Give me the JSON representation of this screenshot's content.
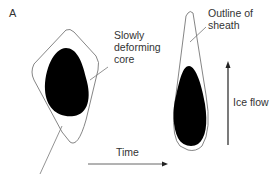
{
  "figure": {
    "panel_label": "A",
    "labels": {
      "core_line1": "Slowly",
      "core_line2": "deforming",
      "core_line3": "core",
      "sheath_line1": "Outline of",
      "sheath_line2": "sheath",
      "time": "Time",
      "ice_flow": "Ice flow"
    },
    "colors": {
      "core_fill": "#000000",
      "outline": "#777777",
      "text": "#333333",
      "arrow": "#222222"
    }
  }
}
